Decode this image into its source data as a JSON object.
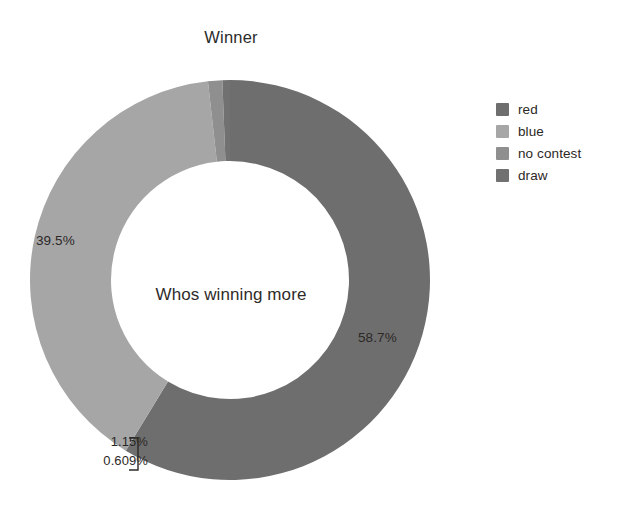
{
  "chart_data": {
    "type": "pie",
    "variant": "donut",
    "title": "Winner",
    "center_label": "Whos winning more",
    "categories": [
      "red",
      "blue",
      "no contest",
      "draw"
    ],
    "values": [
      58.7,
      39.5,
      1.15,
      0.609
    ],
    "value_labels": [
      "58.7%",
      "39.5%",
      "1.15%",
      "0.609%"
    ],
    "colors": [
      "#6e6e6e",
      "#a6a6a6",
      "#8f8f8f",
      "#717171"
    ],
    "start_angle_deg": 0,
    "direction": "clockwise",
    "inner_radius_ratio": 0.595,
    "legend_position": "right",
    "grid": false,
    "xlabel": "",
    "ylabel": "",
    "slices": [
      {
        "name": "red",
        "value": 58.7,
        "label": "58.7%",
        "color": "#6e6e6e"
      },
      {
        "name": "blue",
        "value": 39.5,
        "label": "39.5%",
        "color": "#a6a6a6"
      },
      {
        "name": "no contest",
        "value": 1.15,
        "label": "1.15%",
        "color": "#8f8f8f"
      },
      {
        "name": "draw",
        "value": 0.609,
        "label": "0.609%",
        "color": "#717171"
      }
    ]
  },
  "title": {
    "text": "Winner"
  },
  "donut": {
    "center_text": "Whos winning more",
    "label_red": "58.7%",
    "label_blue": "39.5%",
    "label_no_contest": "1.15%",
    "label_draw": "0.609%"
  },
  "legend": {
    "items": [
      {
        "label": "red",
        "color": "#6e6e6e"
      },
      {
        "label": "blue",
        "color": "#a6a6a6"
      },
      {
        "label": "no contest",
        "color": "#8f8f8f"
      },
      {
        "label": "draw",
        "color": "#717171"
      }
    ]
  }
}
